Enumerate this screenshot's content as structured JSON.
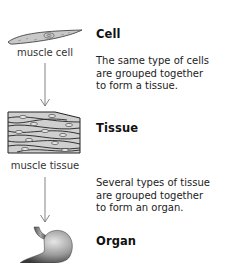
{
  "diagram": {
    "stages": [
      {
        "heading": "Cell",
        "label": "muscle cell",
        "icon": "muscle-cell-illustration"
      },
      {
        "heading": "Tissue",
        "label": "muscle tissue",
        "icon": "muscle-tissue-illustration"
      },
      {
        "heading": "Organ",
        "label": "",
        "icon": "stomach-organ-illustration"
      }
    ],
    "transitions": [
      {
        "text": "The same type of cells\nare grouped together\nto form a tissue."
      },
      {
        "text": "Several types of tissue\nare grouped together\nto form an organ."
      }
    ],
    "colors": {
      "fill_gray": "#c8c8c8",
      "stroke": "#333333",
      "arrow": "#777777"
    }
  }
}
